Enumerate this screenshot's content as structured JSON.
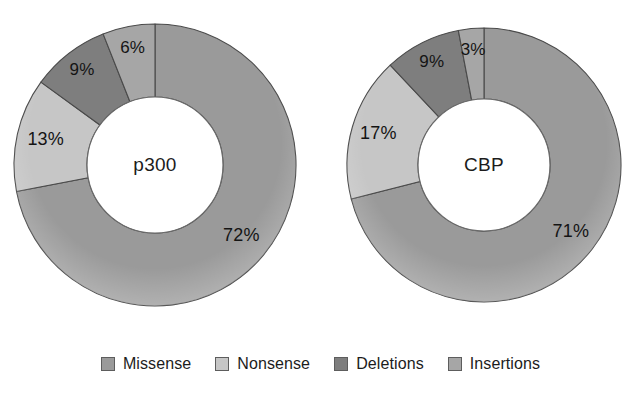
{
  "figure": {
    "background": "#ffffff",
    "width": 641,
    "height": 397
  },
  "palette": {
    "missense": "#9a9a9a",
    "nonsense": "#c6c6c6",
    "deletions": "#7e7e7e",
    "insertions": "#a6a6a6",
    "outline": "#4a4a4a",
    "hole": "#ffffff",
    "text": "#1c1c1c"
  },
  "legend": {
    "position": "bottom-center",
    "items": [
      {
        "label": "Missense",
        "color": "#9a9a9a",
        "swatch": "legend-swatch-missense"
      },
      {
        "label": "Nonsense",
        "color": "#c6c6c6",
        "swatch": "legend-swatch-nonsense"
      },
      {
        "label": "Deletions",
        "color": "#7e7e7e",
        "swatch": "legend-swatch-deletions"
      },
      {
        "label": "Insertions",
        "color": "#a6a6a6",
        "swatch": "legend-swatch-insertions"
      }
    ]
  },
  "chart_data": [
    {
      "type": "pie",
      "variant": "donut",
      "title": "p300",
      "center_label": "p300",
      "categories": [
        "Missense",
        "Nonsense",
        "Deletions",
        "Insertions"
      ],
      "values": [
        72,
        13,
        9,
        6
      ],
      "value_labels": [
        "72%",
        "13%",
        "9%",
        "6%"
      ],
      "colors": [
        "#9a9a9a",
        "#c6c6c6",
        "#7e7e7e",
        "#a6a6a6"
      ],
      "unit": "%",
      "total": 100,
      "start_angle_deg": 0,
      "direction": "clockwise",
      "hole_fraction": 0.48,
      "xlabel": "",
      "ylabel": "",
      "grid": false,
      "legend": "bottom"
    },
    {
      "type": "pie",
      "variant": "donut",
      "title": "CBP",
      "center_label": "CBP",
      "categories": [
        "Missense",
        "Nonsense",
        "Deletions",
        "Insertions"
      ],
      "values": [
        71,
        17,
        9,
        3
      ],
      "value_labels": [
        "71%",
        "17%",
        "9%",
        "3%"
      ],
      "colors": [
        "#9a9a9a",
        "#c6c6c6",
        "#7e7e7e",
        "#a6a6a6"
      ],
      "unit": "%",
      "total": 100,
      "start_angle_deg": 0,
      "direction": "clockwise",
      "hole_fraction": 0.48,
      "xlabel": "",
      "ylabel": "",
      "grid": false,
      "legend": "bottom"
    }
  ]
}
